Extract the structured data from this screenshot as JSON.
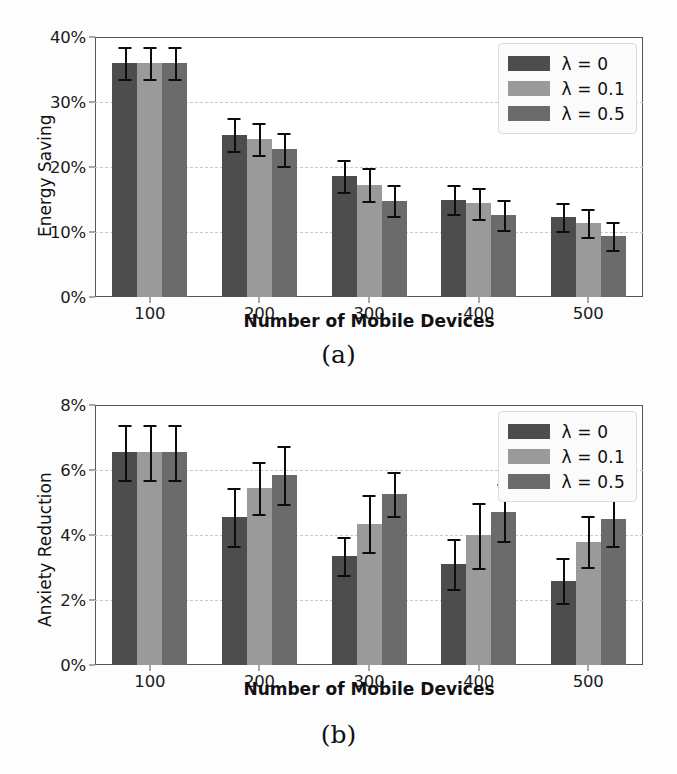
{
  "figure": {
    "panels": [
      {
        "caption": "(a)",
        "chart_key": "0"
      },
      {
        "caption": "(b)",
        "chart_key": "1"
      }
    ]
  },
  "legend": {
    "position": "upper right",
    "entries": [
      {
        "label": "λ = 0",
        "color": "#4d4d4d"
      },
      {
        "label": "λ = 0.1",
        "color": "#9a9a9a"
      },
      {
        "label": "λ = 0.5",
        "color": "#6b6b6b"
      }
    ]
  },
  "chart_data": [
    {
      "type": "bar",
      "title": "",
      "xlabel": "Number of Mobile Devices",
      "ylabel": "Energy Saving",
      "categories": [
        "100",
        "200",
        "300",
        "400",
        "500"
      ],
      "ylim": [
        0,
        40
      ],
      "yticks": [
        0,
        10,
        20,
        30,
        40
      ],
      "ytick_labels": [
        "0%",
        "10%",
        "20%",
        "30%",
        "40%"
      ],
      "grid": true,
      "legend_position": "upper right",
      "series": [
        {
          "name": "λ = 0",
          "color": "#4d4d4d",
          "values": [
            36.0,
            25.0,
            18.6,
            15.0,
            12.3
          ],
          "errors": [
            2.5,
            2.6,
            2.5,
            2.3,
            2.2
          ]
        },
        {
          "name": "λ = 0.1",
          "color": "#9a9a9a",
          "values": [
            36.0,
            24.3,
            17.3,
            14.4,
            11.4
          ],
          "errors": [
            2.5,
            2.4,
            2.5,
            2.4,
            2.1
          ]
        },
        {
          "name": "λ = 0.5",
          "color": "#6b6b6b",
          "values": [
            36.0,
            22.7,
            14.8,
            12.6,
            9.4
          ],
          "errors": [
            2.5,
            2.6,
            2.4,
            2.3,
            2.2
          ]
        }
      ]
    },
    {
      "type": "bar",
      "title": "",
      "xlabel": "Number of Mobile Devices",
      "ylabel": "Anxiety Reduction",
      "categories": [
        "100",
        "200",
        "300",
        "400",
        "500"
      ],
      "ylim": [
        0,
        8
      ],
      "yticks": [
        0,
        2,
        4,
        6,
        8
      ],
      "ytick_labels": [
        "0%",
        "2%",
        "4%",
        "6%",
        "8%"
      ],
      "grid": true,
      "legend_position": "upper right",
      "series": [
        {
          "name": "λ = 0",
          "color": "#4d4d4d",
          "values": [
            6.55,
            4.55,
            3.35,
            3.1,
            2.6
          ],
          "errors": [
            0.85,
            0.9,
            0.58,
            0.77,
            0.68
          ]
        },
        {
          "name": "λ = 0.1",
          "color": "#9a9a9a",
          "values": [
            6.55,
            5.45,
            4.35,
            4.0,
            3.8
          ],
          "errors": [
            0.85,
            0.8,
            0.88,
            1.0,
            0.78
          ]
        },
        {
          "name": "λ = 0.5",
          "color": "#6b6b6b",
          "values": [
            6.55,
            5.85,
            5.25,
            4.7,
            4.5
          ],
          "errors": [
            0.85,
            0.9,
            0.68,
            0.88,
            0.85
          ]
        }
      ]
    }
  ]
}
